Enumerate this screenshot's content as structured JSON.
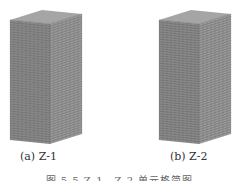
{
  "figures": [
    {
      "label": "(a)  Z-1",
      "id": "Z-1"
    },
    {
      "label": "(b)  Z-2",
      "id": "Z-2"
    }
  ],
  "caption": "图 5.5  Z-1、Z-2 单元格简图",
  "colors": {
    "mesh": "#555555",
    "background": "#ffffff"
  }
}
